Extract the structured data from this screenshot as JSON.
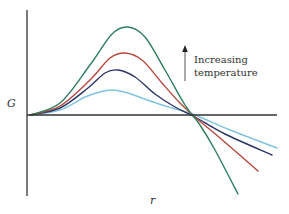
{
  "chart_data": {
    "type": "line",
    "title": "",
    "xlabel": "r",
    "ylabel": "G",
    "grid": false,
    "legend": null,
    "annotation": {
      "text_lines": [
        "Increasing",
        "temperature"
      ],
      "arrow": "up"
    },
    "series": [
      {
        "name": "highest temperature",
        "color": "#2e7d5b",
        "points": [
          [
            30,
            115
          ],
          [
            60,
            103
          ],
          [
            90,
            65
          ],
          [
            112,
            34
          ],
          [
            128,
            27
          ],
          [
            145,
            37
          ],
          [
            165,
            70
          ],
          [
            185,
            105
          ],
          [
            200,
            125
          ],
          [
            215,
            150
          ],
          [
            238,
            194
          ]
        ]
      },
      {
        "name": "high temperature",
        "color": "#b5483c",
        "points": [
          [
            30,
            115
          ],
          [
            60,
            106
          ],
          [
            90,
            80
          ],
          [
            110,
            58
          ],
          [
            125,
            53
          ],
          [
            142,
            60
          ],
          [
            162,
            83
          ],
          [
            180,
            103
          ],
          [
            196,
            118
          ],
          [
            220,
            138
          ],
          [
            258,
            171
          ]
        ]
      },
      {
        "name": "medium temperature",
        "color": "#2c3566",
        "points": [
          [
            30,
            115
          ],
          [
            60,
            108
          ],
          [
            88,
            88
          ],
          [
            105,
            73
          ],
          [
            118,
            70
          ],
          [
            135,
            77
          ],
          [
            155,
            94
          ],
          [
            175,
            107
          ],
          [
            195,
            117
          ],
          [
            225,
            134
          ],
          [
            272,
            155
          ]
        ]
      },
      {
        "name": "lowest temperature",
        "color": "#7fc3e0",
        "points": [
          [
            30,
            115
          ],
          [
            60,
            110
          ],
          [
            85,
            97
          ],
          [
            100,
            92
          ],
          [
            112,
            90
          ],
          [
            128,
            93
          ],
          [
            150,
            101
          ],
          [
            172,
            108
          ],
          [
            195,
            115
          ],
          [
            230,
            130
          ],
          [
            277,
            148
          ]
        ]
      }
    ],
    "axes": {
      "y_axis": {
        "x": 27,
        "y_top": 10,
        "y_bottom": 196
      },
      "x_axis": {
        "y": 115,
        "x_left": 27,
        "x_right": 277
      }
    }
  },
  "labels": {
    "y_axis": "G",
    "x_axis": "r",
    "annotation_line1": "Increasing",
    "annotation_line2": "temperature"
  }
}
